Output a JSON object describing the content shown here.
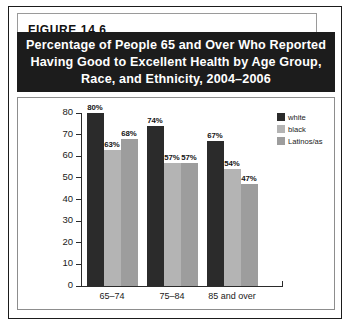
{
  "figure": {
    "label": "FIGURE  14.6",
    "title_lines": [
      "Percentage of People 65 and Over Who Reported",
      "Having Good to Excellent Health by Age Group,",
      "Race, and Ethnicity, 2004–2006"
    ]
  },
  "colors": {
    "white_series": "#2b2b2b",
    "black_series": "#b4b4b4",
    "latinos_series": "#9d9d9d",
    "title_band": "#1c1c1c",
    "title_text": "#ffffff",
    "axis": "#2b2b2b",
    "frame": "#1b1b1b"
  },
  "chart_data": {
    "type": "bar",
    "title": "Percentage of People 65 and Over Who Reported Having Good to Excellent Health by Age Group, Race, and Ethnicity, 2004–2006",
    "xlabel": "",
    "ylabel": "",
    "ylim": [
      0,
      80
    ],
    "yticks": [
      0,
      10,
      20,
      30,
      40,
      50,
      60,
      70,
      80
    ],
    "ytick_labels": [
      "0",
      "10",
      "20",
      "30",
      "40",
      "50",
      "60",
      "70",
      "80"
    ],
    "grid": false,
    "legend_position": "top-right",
    "categories": [
      "65–74",
      "75–84",
      "85 and over"
    ],
    "series": [
      {
        "name": "white",
        "values": [
          80,
          74,
          67
        ],
        "labels": [
          "80%",
          "74%",
          "67%"
        ],
        "color": "#2b2b2b"
      },
      {
        "name": "black",
        "values": [
          63,
          57,
          54
        ],
        "labels": [
          "63%",
          "57%",
          "54%"
        ],
        "color": "#b4b4b4"
      },
      {
        "name": "Latinos/as",
        "values": [
          68,
          57,
          47
        ],
        "labels": [
          "68%",
          "57%",
          "47%"
        ],
        "color": "#9d9d9d"
      }
    ]
  }
}
